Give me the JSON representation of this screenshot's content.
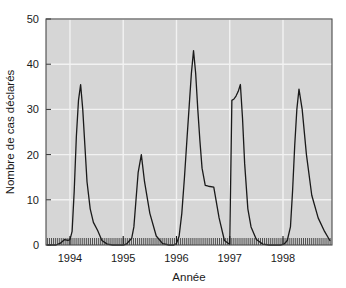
{
  "chart_data": {
    "type": "line",
    "title": "",
    "subtitle": "",
    "xlabel": "Année",
    "ylabel": "Nombre de cas déclarés",
    "xlim": [
      1993.55,
      1998.92
    ],
    "ylim": [
      0,
      50
    ],
    "y_ticks": [
      0,
      10,
      20,
      30,
      40,
      50
    ],
    "y_tick_labels": [
      "0",
      "10",
      "20",
      "30",
      "40",
      "50"
    ],
    "x_ticks": [
      1994,
      1995,
      1996,
      1997,
      1998
    ],
    "x_tick_labels": [
      "1994",
      "1995",
      "1996",
      "1997",
      "1998"
    ],
    "minor_x_ticks_per_year": 26,
    "grid": "white gridlines on grey panel, horizontal at y ticks and vertical at year ticks",
    "legend": "none",
    "annotations": [],
    "series": [
      {
        "name": "Nombre de cas déclarés",
        "color": "#1a1a1a",
        "line_width": 1.3,
        "x": [
          1993.58,
          1993.66,
          1993.74,
          1993.82,
          1993.9,
          1993.96,
          1994.0,
          1994.04,
          1994.08,
          1994.12,
          1994.16,
          1994.2,
          1994.24,
          1994.28,
          1994.32,
          1994.38,
          1994.44,
          1994.52,
          1994.6,
          1994.7,
          1994.8,
          1994.9,
          1995.0,
          1995.06,
          1995.12,
          1995.16,
          1995.2,
          1995.24,
          1995.28,
          1995.34,
          1995.4,
          1995.5,
          1995.62,
          1995.74,
          1995.86,
          1995.95,
          1996.0,
          1996.05,
          1996.1,
          1996.15,
          1996.2,
          1996.24,
          1996.28,
          1996.32,
          1996.36,
          1996.4,
          1996.44,
          1996.48,
          1996.54,
          1996.6,
          1996.7,
          1996.8,
          1996.9,
          1996.99,
          1997.0,
          1997.04,
          1997.08,
          1997.12,
          1997.16,
          1997.2,
          1997.24,
          1997.28,
          1997.34,
          1997.4,
          1997.5,
          1997.62,
          1997.74,
          1997.86,
          1997.95,
          1998.02,
          1998.08,
          1998.14,
          1998.18,
          1998.22,
          1998.26,
          1998.3,
          1998.36,
          1998.44,
          1998.54,
          1998.66,
          1998.78,
          1998.88
        ],
        "y": [
          0,
          0,
          0,
          0.4,
          1.2,
          1.0,
          1.2,
          3.0,
          12.0,
          24.0,
          32.0,
          35.5,
          30.0,
          22.0,
          14.0,
          8.0,
          5.0,
          3.2,
          1.0,
          0.2,
          0,
          0,
          0,
          0.2,
          1.0,
          1.5,
          4.0,
          10.0,
          16.0,
          20.0,
          14.0,
          7.0,
          2.0,
          0.3,
          0,
          0,
          0.3,
          2.0,
          7.0,
          15.0,
          24.0,
          31.0,
          38.0,
          43.0,
          38.0,
          30.0,
          23.0,
          17.0,
          13.2,
          13.0,
          12.8,
          6.0,
          1.0,
          0.2,
          0.2,
          32.0,
          32.3,
          33.0,
          34.0,
          35.5,
          28.0,
          18.0,
          8.0,
          4.0,
          1.2,
          0.2,
          0,
          0,
          0,
          0.2,
          1.0,
          4.0,
          12.0,
          22.0,
          30.0,
          34.5,
          30.0,
          20.0,
          11.0,
          6.0,
          3.0,
          1.0
        ]
      }
    ],
    "peaks": [
      {
        "year": 1994,
        "value": 35.5
      },
      {
        "year": 1995,
        "value": 20.0
      },
      {
        "year": 1996,
        "value": 43.0
      },
      {
        "year": 1997,
        "value": 35.5
      },
      {
        "year": 1998,
        "value": 34.5
      }
    ],
    "colors": {
      "line": "#1a1a1a",
      "panel_background": "#d6d6d6",
      "gridline": "#f2f2f2",
      "axis_frame": "#4a4a4a",
      "page_background": "#ffffff",
      "text": "#1a1a1a"
    }
  }
}
